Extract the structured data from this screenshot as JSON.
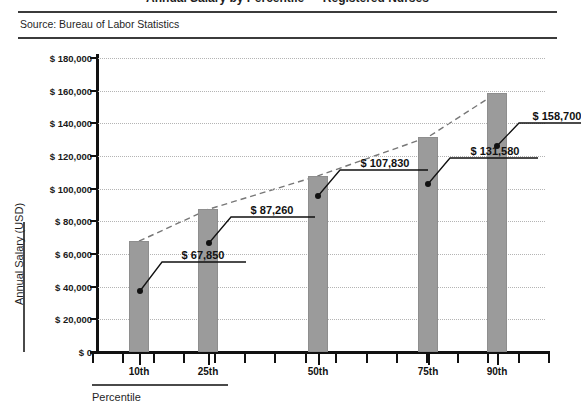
{
  "header": {
    "clipped_title": "Annual Salary by Percentile — Registered Nurses",
    "source": "Source: Bureau of Labor Statistics"
  },
  "axes": {
    "y_title": "Annual Salary (USD)",
    "x_title": "Percentile",
    "y_ticks": [
      "$ 0",
      "$ 20,000",
      "$ 40,000",
      "$ 60,000",
      "$ 80,000",
      "$ 100,000",
      "$ 120,000",
      "$ 140,000",
      "$ 160,000",
      "$ 180,000"
    ],
    "x_ticks": [
      "10th",
      "25th",
      "50th",
      "75th",
      "90th"
    ]
  },
  "colors": {
    "bar_fill": "#9b9b9b",
    "bar_stroke": "#8e8e8e",
    "axis": "#111111",
    "gridline": "#b4b4b4",
    "rule": "#3b3b3b",
    "text": "#1a1a1a"
  },
  "chart_data": {
    "type": "bar",
    "title": "Annual Salary by Percentile — Registered Nurses",
    "subtitle": "Source: Bureau of Labor Statistics",
    "xlabel": "Percentile",
    "ylabel": "Annual Salary (USD)",
    "categories": [
      "10th",
      "25th",
      "50th",
      "75th",
      "90th"
    ],
    "values": [
      67850,
      87260,
      107830,
      131580,
      158700
    ],
    "data_labels": [
      "$ 67,850",
      "$ 87,260",
      "$ 107,830",
      "$ 131,580",
      "$ 158,700"
    ],
    "ylim": [
      0,
      180000
    ],
    "ytick_step": 20000,
    "ytick_values": [
      0,
      20000,
      40000,
      60000,
      80000,
      100000,
      120000,
      140000,
      160000,
      180000
    ],
    "grid": true,
    "grid_style": "dotted-horizontal",
    "legend": "none",
    "overlay": {
      "type": "line",
      "style": "dashed",
      "name": "trend",
      "values": [
        67850,
        87260,
        107830,
        131580,
        158700
      ]
    }
  }
}
